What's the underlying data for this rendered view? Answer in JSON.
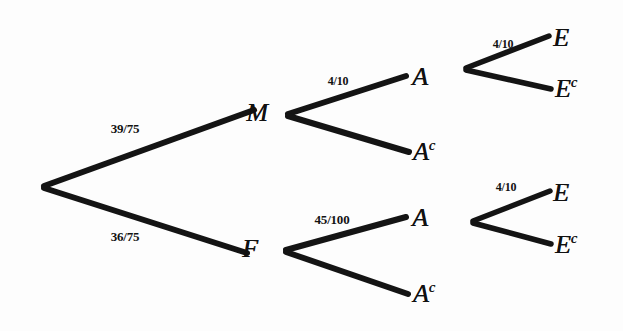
{
  "diagram": {
    "type": "probability-tree",
    "background_color": "#fdfdfd",
    "ink_color": "#111111",
    "nodes": [
      {
        "id": "root",
        "label": "",
        "superscript": "",
        "x": 43,
        "y": 185
      },
      {
        "id": "m",
        "label": "M",
        "superscript": "",
        "x": 257,
        "y": 113
      },
      {
        "id": "f",
        "label": "F",
        "superscript": "",
        "x": 250,
        "y": 249
      },
      {
        "id": "m-a",
        "label": "A",
        "superscript": "",
        "x": 420,
        "y": 77
      },
      {
        "id": "m-ac",
        "label": "A",
        "superscript": "c",
        "x": 421,
        "y": 152
      },
      {
        "id": "f-a",
        "label": "A",
        "superscript": "",
        "x": 420,
        "y": 218
      },
      {
        "id": "f-ac",
        "label": "A",
        "superscript": "c",
        "x": 421,
        "y": 294
      },
      {
        "id": "m-a-e",
        "label": "E",
        "superscript": "",
        "x": 561,
        "y": 38
      },
      {
        "id": "m-a-ec",
        "label": "E",
        "superscript": "c",
        "x": 562,
        "y": 89
      },
      {
        "id": "f-a-e",
        "label": "E",
        "superscript": "",
        "x": 561,
        "y": 193
      },
      {
        "id": "f-a-ec",
        "label": "E",
        "superscript": "c",
        "x": 562,
        "y": 245
      }
    ],
    "edges": [
      {
        "id": "root-m",
        "from": "root",
        "to": "m",
        "label": "39/75",
        "label_x": 125,
        "label_y": 128
      },
      {
        "id": "root-f",
        "from": "root",
        "to": "f",
        "label": "36/75",
        "label_x": 125,
        "label_y": 236
      },
      {
        "id": "m-a",
        "from": "m",
        "to": "m-a",
        "label": "4/10",
        "label_x": 338,
        "label_y": 81
      },
      {
        "id": "m-ac",
        "from": "m",
        "to": "m-ac",
        "label": "",
        "label_x": 0,
        "label_y": 0
      },
      {
        "id": "f-a",
        "from": "f",
        "to": "f-a",
        "label": "45/100",
        "label_x": 332,
        "label_y": 219
      },
      {
        "id": "f-ac",
        "from": "f",
        "to": "f-ac",
        "label": "",
        "label_x": 0,
        "label_y": 0
      },
      {
        "id": "m-a-e",
        "from": "m-a",
        "to": "m-a-e",
        "label": "4/10",
        "label_x": 503,
        "label_y": 44
      },
      {
        "id": "m-a-ec",
        "from": "m-a",
        "to": "m-a-ec",
        "label": "",
        "label_x": 0,
        "label_y": 0
      },
      {
        "id": "f-a-e",
        "from": "f-a",
        "to": "f-a-e",
        "label": "4/10",
        "label_x": 506,
        "label_y": 187
      },
      {
        "id": "f-a-ec",
        "from": "f-a",
        "to": "f-a-ec",
        "label": "",
        "label_x": 0,
        "label_y": 0
      }
    ],
    "labels": {
      "root_m": "39/75",
      "root_f": "36/75",
      "m_a": "4/10",
      "f_a": "45/100",
      "m_a_e": "4/10",
      "f_a_e": "4/10",
      "node_m": "M",
      "node_f": "F",
      "node_a": "A",
      "node_ac_base": "A",
      "node_ac_sup": "c",
      "node_e": "E",
      "node_ec_base": "E",
      "node_ec_sup": "c"
    }
  }
}
